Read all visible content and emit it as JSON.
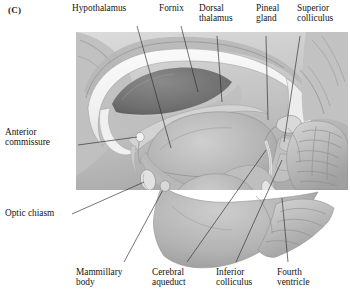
{
  "figure": {
    "panel_letter": "(C)",
    "type": "anatomical-illustration",
    "rendering": "grayscale pencil/airbrush drawing",
    "panel_rect": {
      "x": 76,
      "y": 32,
      "width": 272,
      "height": 158
    },
    "panel_fill": "#c9c9c9",
    "line_color": "#2b2b2b",
    "labels": {
      "hypothalamus": "Hypothalamus",
      "fornix": "Fornix",
      "dorsal_thalamus_line1": "Dorsal",
      "dorsal_thalamus_line2": "thalamus",
      "pineal_gland_line1": "Pineal",
      "pineal_gland_line2": "gland",
      "superior_colliculus_line1": "Superior",
      "superior_colliculus_line2": "colliculus",
      "anterior_commissure_line1": "Anterior",
      "anterior_commissure_line2": "commissure",
      "optic_chiasm": "Optic chiasm",
      "mammillary_body_line1": "Mammillary",
      "mammillary_body_line2": "body",
      "cerebral_aqueduct_line1": "Cerebral",
      "cerebral_aqueduct_line2": "aqueduct",
      "inferior_colliculus_line1": "Inferior",
      "inferior_colliculus_line2": "colliculus",
      "fourth_ventricle_line1": "Fourth",
      "fourth_ventricle_line2": "ventricle"
    },
    "structures_depicted": [
      "corpus callosum",
      "lateral ventricle",
      "cingulate gyrus",
      "fornix",
      "dorsal thalamus",
      "hypothalamus",
      "anterior commissure",
      "optic chiasm",
      "mammillary body",
      "pineal gland",
      "superior colliculus",
      "inferior colliculus",
      "cerebral aqueduct",
      "fourth ventricle",
      "pons",
      "medulla",
      "cerebellum",
      "midbrain"
    ]
  }
}
